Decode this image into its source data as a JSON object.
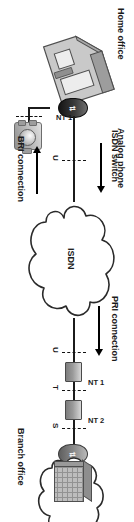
{
  "diagram": {
    "orientation_degrees": 90,
    "colors": {
      "line": "#1b1b1b",
      "cloud_stroke": "#2a2a2a",
      "device_dark": "#141414",
      "device_light": "#8c8c8c",
      "background": "#ffffff"
    },
    "nodes": [
      {
        "id": "home-office",
        "label": "Home office",
        "type": "house"
      },
      {
        "id": "analog-phone",
        "label": "Analog phone",
        "type": "phone"
      },
      {
        "id": "nt1-home",
        "label": "NT 1",
        "type": "terminator"
      },
      {
        "id": "isdn-cloud",
        "label": "ISDN",
        "type": "cloud"
      },
      {
        "id": "branch-office",
        "label": "Branch office",
        "type": "building"
      },
      {
        "id": "nt1-branch",
        "label": "NT 1",
        "type": "terminator"
      },
      {
        "id": "nt2-branch",
        "label": "NT 2",
        "type": "terminator"
      }
    ],
    "callouts": [
      {
        "id": "isdn-switch",
        "label": "ISDN switch",
        "arrow": "right"
      },
      {
        "id": "bri-connection",
        "label": "BRI connection",
        "arrow": "left"
      },
      {
        "id": "pri-connection",
        "label": "PRI connection",
        "arrow": "right"
      }
    ],
    "reference_points": {
      "bri": [
        {
          "label": "U"
        }
      ],
      "pri": [
        {
          "label": "U"
        },
        {
          "label": "T"
        },
        {
          "label": "S"
        }
      ]
    }
  }
}
